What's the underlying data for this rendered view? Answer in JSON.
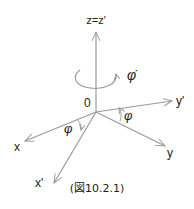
{
  "diagram": {
    "type": "coordinate-rotation",
    "line_color": "#9a9a9a",
    "text_color": "#222222",
    "origin": {
      "label": "0",
      "x": 96,
      "y": 112
    },
    "axes": [
      {
        "id": "z",
        "label": "z=z'",
        "x2": 96,
        "y2": 32
      },
      {
        "id": "yp",
        "label": "y'",
        "x2": 172,
        "y2": 101
      },
      {
        "id": "y",
        "label": "y",
        "x2": 165,
        "y2": 146
      },
      {
        "id": "x",
        "label": "x",
        "x2": 25,
        "y2": 141
      },
      {
        "id": "xp",
        "label": "x'",
        "x2": 54,
        "y2": 183
      }
    ],
    "rotation_label": "φ̇",
    "angle_label_xy": "φ",
    "angle_label_yy": "φ",
    "caption": "(図10.2.1)"
  }
}
